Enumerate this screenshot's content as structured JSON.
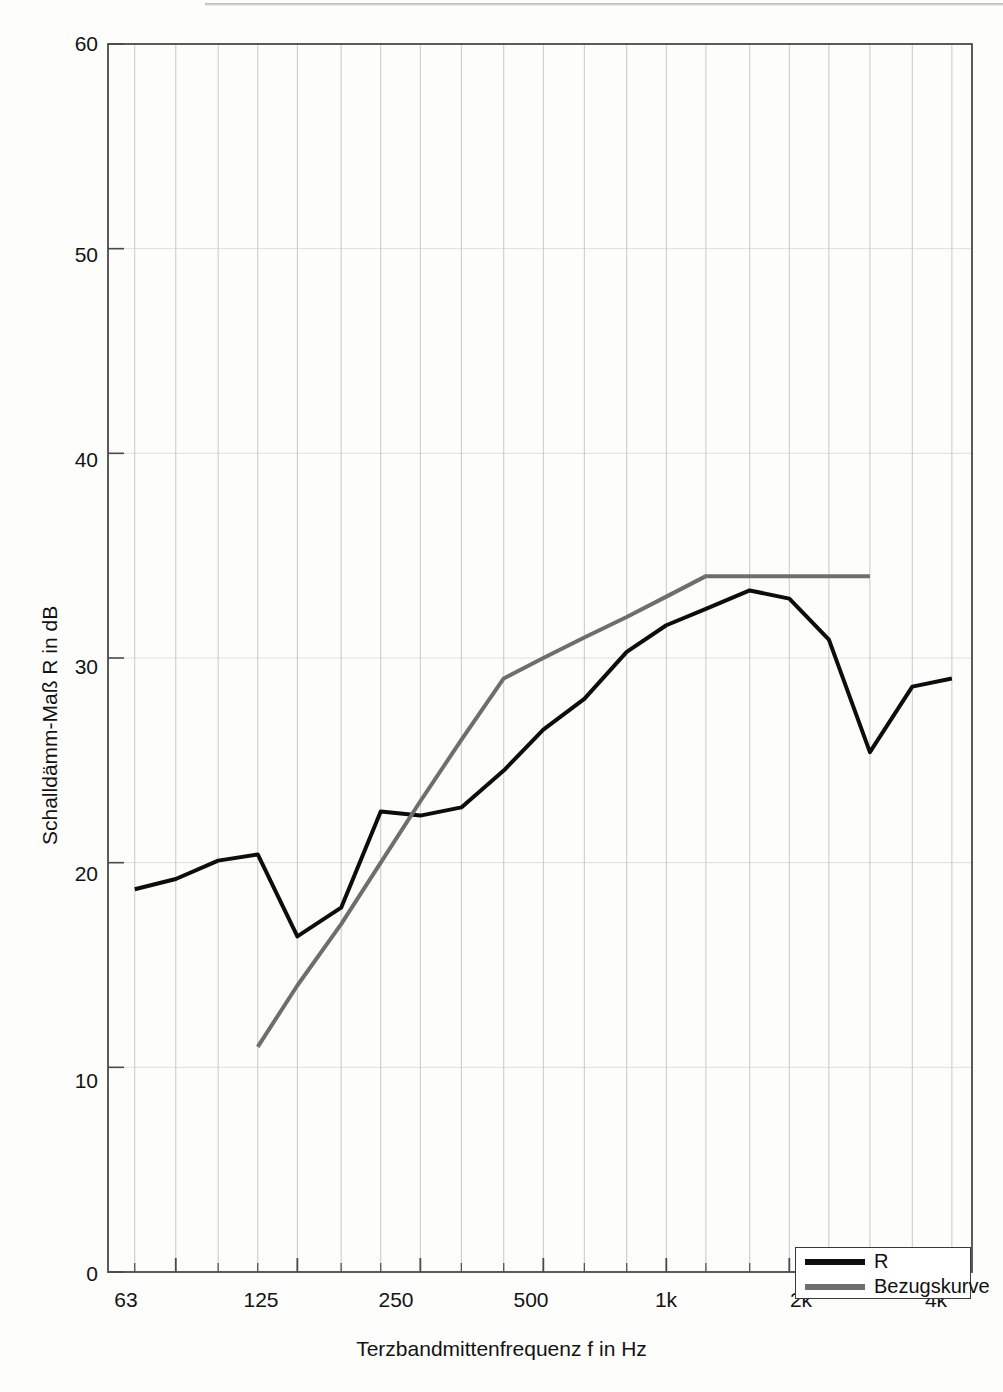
{
  "figure": {
    "background_color": "#fdfdfc",
    "frame_color": "#4a4a4a",
    "grid_color": "#c8c8c8"
  },
  "axes": {
    "y_title": "Schalldämm-Maß R in dB",
    "x_title": "Terzbandmittenfrequenz f in Hz",
    "y_ticks": [
      "0",
      "10",
      "20",
      "30",
      "40",
      "50",
      "60"
    ],
    "x_ticks": [
      "63",
      "125",
      "250",
      "500",
      "1k",
      "2k",
      "4k"
    ]
  },
  "legend": {
    "items": [
      {
        "label": "R",
        "color": "#0d0d0d"
      },
      {
        "label": "Bezugskurve",
        "color": "#6e6e6e"
      }
    ]
  },
  "chart_data": {
    "type": "line",
    "title": "",
    "subtitle": "",
    "xlabel": "Terzbandmittenfrequenz f in Hz",
    "ylabel": "Schalldämm-Maß R in dB",
    "xscale": "log-thirdoctave",
    "x_tick_labels": [
      "63",
      "125",
      "250",
      "500",
      "1k",
      "2k",
      "4k"
    ],
    "x_tick_values": [
      63,
      125,
      250,
      500,
      1000,
      2000,
      4000
    ],
    "x_bands_hz": [
      50,
      63,
      80,
      100,
      125,
      160,
      200,
      250,
      315,
      400,
      500,
      630,
      800,
      1000,
      1250,
      1600,
      2000,
      2500,
      3150,
      4000,
      5000
    ],
    "xlim_bands": [
      43,
      5600
    ],
    "ylim": [
      0,
      60
    ],
    "y_ticks": [
      0,
      10,
      20,
      30,
      40,
      50,
      60
    ],
    "grid": "vertical-bands-and-horizontal-ticks",
    "legend_position": "bottom-right",
    "series": [
      {
        "name": "R",
        "color": "#0d0d0d",
        "linewidth": 4,
        "x": [
          50,
          63,
          80,
          100,
          125,
          160,
          200,
          250,
          315,
          400,
          500,
          630,
          800,
          1000,
          1250,
          1600,
          2000,
          2500,
          3150,
          4000,
          5000
        ],
        "values": [
          18.7,
          19.2,
          20.1,
          20.4,
          16.4,
          17.8,
          22.5,
          22.3,
          22.7,
          24.5,
          26.5,
          28.0,
          30.3,
          31.6,
          32.4,
          33.3,
          32.9,
          30.9,
          25.4,
          28.6,
          29.0
        ]
      },
      {
        "name": "Bezugskurve",
        "color": "#6e6e6e",
        "linewidth": 4,
        "x": [
          100,
          125,
          160,
          200,
          250,
          315,
          400,
          500,
          630,
          800,
          1000,
          1250,
          1600,
          2000,
          2500,
          3150
        ],
        "values": [
          11.0,
          14.0,
          17.0,
          20.0,
          23.0,
          26.0,
          29.0,
          30.0,
          31.0,
          32.0,
          33.0,
          34.0,
          34.0,
          34.0,
          34.0,
          34.0
        ]
      }
    ]
  }
}
